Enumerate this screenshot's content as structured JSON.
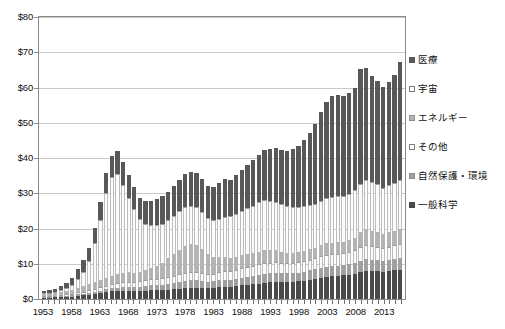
{
  "chart_data": {
    "type": "bar",
    "subtype": "stacked-bar",
    "title": "",
    "xlabel": "",
    "ylabel": "",
    "ylim": [
      0,
      80
    ],
    "ytick_labels": [
      "$0",
      "$10",
      "$20",
      "$30",
      "$40",
      "$50",
      "$60",
      "$70",
      "$80"
    ],
    "ytick_values": [
      0,
      10,
      20,
      30,
      40,
      50,
      60,
      70,
      80
    ],
    "grid": true,
    "legend_position": "right",
    "x_label_step": 5,
    "x_label_start": "1953",
    "xtick_labels": [
      "1953",
      "1958",
      "1963",
      "1968",
      "1973",
      "1978",
      "1983",
      "1988",
      "1993",
      "1998",
      "2003",
      "2008",
      "2013"
    ],
    "categories": [
      "1953",
      "1954",
      "1955",
      "1956",
      "1957",
      "1958",
      "1959",
      "1960",
      "1961",
      "1962",
      "1963",
      "1964",
      "1965",
      "1966",
      "1967",
      "1968",
      "1969",
      "1970",
      "1971",
      "1972",
      "1973",
      "1974",
      "1975",
      "1976",
      "1977",
      "1978",
      "1979",
      "1980",
      "1981",
      "1982",
      "1983",
      "1984",
      "1985",
      "1986",
      "1987",
      "1988",
      "1989",
      "1990",
      "1991",
      "1992",
      "1993",
      "1994",
      "1995",
      "1996",
      "1997",
      "1998",
      "1999",
      "2000",
      "2001",
      "2002",
      "2003",
      "2004",
      "2005",
      "2006",
      "2007",
      "2008",
      "2009",
      "2010",
      "2011",
      "2012",
      "2013",
      "2014",
      "2015",
      "2016"
    ],
    "series": [
      {
        "name": "一般科学",
        "color": "#4a4a4c",
        "values": [
          0.4,
          0.4,
          0.5,
          0.5,
          0.6,
          0.7,
          0.9,
          1.0,
          1.2,
          1.5,
          1.8,
          2.0,
          2.2,
          2.3,
          2.4,
          2.4,
          2.3,
          2.3,
          2.4,
          2.5,
          2.5,
          2.5,
          2.6,
          2.7,
          2.9,
          3.1,
          3.2,
          3.2,
          3.1,
          3.0,
          3.1,
          3.3,
          3.5,
          3.5,
          3.7,
          3.9,
          4.0,
          4.2,
          4.4,
          4.6,
          4.7,
          4.8,
          4.8,
          4.8,
          4.9,
          5.0,
          5.2,
          5.5,
          5.7,
          6.0,
          6.3,
          6.5,
          6.6,
          6.7,
          6.9,
          7.2,
          7.6,
          7.9,
          7.9,
          7.9,
          7.7,
          7.9,
          8.1,
          8.3
        ]
      },
      {
        "name": "自然保護・環境",
        "color": "#a0a0a0",
        "values": [
          0.2,
          0.2,
          0.2,
          0.3,
          0.3,
          0.3,
          0.4,
          0.4,
          0.5,
          0.5,
          0.6,
          0.7,
          0.8,
          0.9,
          1.0,
          1.1,
          1.1,
          1.2,
          1.3,
          1.4,
          1.5,
          1.6,
          1.7,
          1.8,
          1.9,
          2.0,
          2.1,
          2.1,
          2.0,
          1.9,
          1.9,
          2.0,
          2.0,
          2.0,
          2.1,
          2.2,
          2.3,
          2.4,
          2.5,
          2.6,
          2.6,
          2.6,
          2.5,
          2.5,
          2.5,
          2.5,
          2.6,
          2.6,
          2.7,
          2.8,
          2.9,
          2.9,
          2.9,
          2.9,
          3.0,
          3.1,
          3.3,
          3.4,
          3.3,
          3.2,
          3.1,
          3.2,
          3.3,
          3.4
        ]
      },
      {
        "name": "その他",
        "color": "#fbfbfb",
        "values": [
          0.3,
          0.3,
          0.3,
          0.4,
          0.4,
          0.5,
          0.6,
          0.7,
          0.8,
          0.9,
          1.0,
          1.1,
          1.2,
          1.3,
          1.4,
          1.4,
          1.4,
          1.5,
          1.6,
          1.7,
          1.8,
          1.9,
          2.0,
          2.1,
          2.2,
          2.3,
          2.4,
          2.4,
          2.3,
          2.2,
          2.2,
          2.3,
          2.4,
          2.4,
          2.5,
          2.6,
          2.7,
          2.8,
          2.9,
          3.0,
          3.0,
          3.0,
          2.9,
          2.9,
          2.9,
          2.9,
          3.0,
          3.1,
          3.2,
          3.3,
          3.4,
          3.4,
          3.4,
          3.4,
          3.5,
          3.6,
          3.8,
          3.9,
          3.8,
          3.7,
          3.6,
          3.7,
          3.8,
          3.9
        ]
      },
      {
        "name": "エネルギー",
        "color": "#b4b4b4",
        "values": [
          0.5,
          0.6,
          0.7,
          0.8,
          0.9,
          1.1,
          1.3,
          1.5,
          1.7,
          1.9,
          2.1,
          2.3,
          2.4,
          2.5,
          2.6,
          2.7,
          2.7,
          2.8,
          3.0,
          3.3,
          3.7,
          4.3,
          5.2,
          6.1,
          7.0,
          7.6,
          7.8,
          7.6,
          6.8,
          5.6,
          4.6,
          4.2,
          4.0,
          3.8,
          3.7,
          3.7,
          3.7,
          3.6,
          3.6,
          3.6,
          3.5,
          3.4,
          3.2,
          3.0,
          2.9,
          2.9,
          2.9,
          2.9,
          3.0,
          3.1,
          3.2,
          3.2,
          3.2,
          3.2,
          3.3,
          3.5,
          4.2,
          4.6,
          4.4,
          4.2,
          4.0,
          4.1,
          4.2,
          4.3
        ]
      },
      {
        "name": "宇宙",
        "color": "#fbfbfb",
        "values": [
          0.1,
          0.2,
          0.3,
          0.5,
          0.8,
          1.4,
          2.6,
          4.2,
          6.5,
          11.0,
          17.0,
          24.0,
          28.0,
          28.5,
          25.0,
          21.0,
          18.0,
          15.0,
          13.0,
          12.0,
          11.5,
          11.0,
          11.0,
          11.0,
          11.0,
          11.2,
          11.0,
          10.8,
          10.5,
          10.2,
          10.5,
          11.0,
          11.5,
          11.8,
          12.0,
          12.5,
          13.0,
          13.5,
          14.0,
          14.2,
          14.0,
          13.8,
          13.5,
          13.2,
          13.0,
          12.8,
          12.6,
          12.5,
          12.4,
          12.6,
          12.8,
          13.0,
          13.0,
          13.0,
          13.2,
          13.4,
          13.8,
          14.0,
          13.8,
          13.5,
          13.2,
          13.4,
          13.6,
          13.8
        ]
      },
      {
        "name": "医療",
        "color": "#58585a",
        "values": [
          0.5,
          0.7,
          0.9,
          1.2,
          1.6,
          2.0,
          2.6,
          3.2,
          3.8,
          4.4,
          5.0,
          5.6,
          6.1,
          6.5,
          6.6,
          6.5,
          6.2,
          6.0,
          6.4,
          7.0,
          7.4,
          7.8,
          8.0,
          8.3,
          8.7,
          9.2,
          9.5,
          9.6,
          9.3,
          9.1,
          9.4,
          10.0,
          10.6,
          10.4,
          11.2,
          11.8,
          12.3,
          12.9,
          13.6,
          14.2,
          14.7,
          15.2,
          15.4,
          15.6,
          16.3,
          17.2,
          18.8,
          20.6,
          22.8,
          25.2,
          27.2,
          28.6,
          28.8,
          28.4,
          28.6,
          29.0,
          32.5,
          31.8,
          30.2,
          29.5,
          28.6,
          29.4,
          30.5,
          33.5
        ]
      }
    ]
  },
  "axes": {
    "y_ticks": [
      "$80",
      "$70",
      "$60",
      "$50",
      "$40",
      "$30",
      "$20",
      "$10",
      "$0"
    ],
    "x_ticks": [
      "1953",
      "1958",
      "1963",
      "1968",
      "1973",
      "1978",
      "1983",
      "1988",
      "1993",
      "1998",
      "2003",
      "2008",
      "2013"
    ]
  },
  "legend": {
    "items": [
      {
        "label": "医療",
        "swatch": "sw-med"
      },
      {
        "label": "宇宙",
        "swatch": "sw-space"
      },
      {
        "label": "エネルギー",
        "swatch": "sw-energy"
      },
      {
        "label": "その他",
        "swatch": "sw-other"
      },
      {
        "label": "自然保護・環境",
        "swatch": "sw-env"
      },
      {
        "label": "一般科学",
        "swatch": "sw-gen"
      }
    ]
  },
  "colors": {
    "medical": "#58585a",
    "space": "#fbfbfb",
    "energy": "#b4b4b4",
    "other": "#fbfbfb",
    "environment": "#a0a0a0",
    "general_science": "#4a4a4c",
    "grid": "#c9c9c9",
    "frame": "#8a8a8a"
  }
}
